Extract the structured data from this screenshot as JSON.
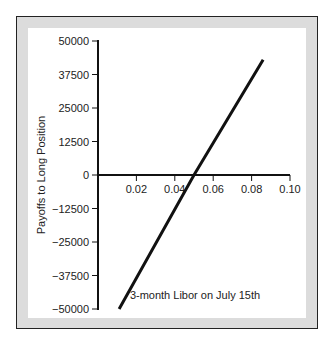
{
  "chart_data": {
    "type": "line",
    "title": "",
    "xlabel": "3-month Libor on July 15th",
    "ylabel": "Payoffs to Long Position",
    "x_ticks": [
      "0.02",
      "0.04",
      "0.06",
      "0.08",
      "0.10"
    ],
    "y_ticks": [
      "50000",
      "37500",
      "25000",
      "12500",
      "0",
      "−12500",
      "−25000",
      "−37500",
      "−50000"
    ],
    "xlim": [
      0,
      0.1
    ],
    "ylim": [
      -50000,
      50000
    ],
    "grid": false,
    "series": [
      {
        "name": "Payoff",
        "x": [
          0.011,
          0.05,
          0.086
        ],
        "y": [
          -50000,
          0,
          43000
        ]
      }
    ]
  }
}
